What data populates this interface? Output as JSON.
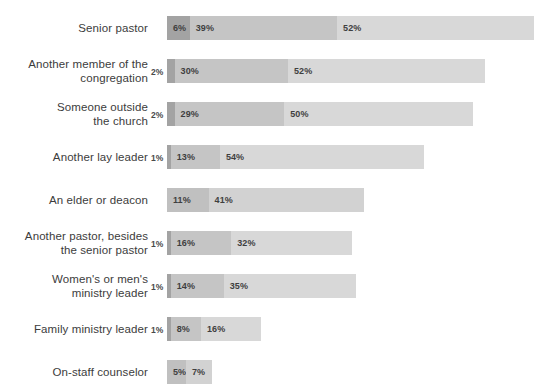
{
  "chart_data": {
    "type": "bar",
    "orientation": "horizontal",
    "stacked": true,
    "title": "",
    "subtitle": "",
    "xlabel": "",
    "ylabel": "",
    "xlim": [
      0,
      100
    ],
    "grid": false,
    "legend": "none",
    "unit": "%",
    "categories": [
      "Senior pastor",
      "Another member of the\ncongregation",
      "Someone outside\nthe church",
      "Another lay leader",
      "An elder or deacon",
      "Another pastor, besides\nthe senior pastor",
      "Women's or men's\nministry leader",
      "Family ministry leader",
      "On-staff counselor"
    ],
    "series": [
      {
        "name": "segment-1",
        "color": "#a3a3a3",
        "values": [
          6,
          2,
          2,
          1,
          11,
          1,
          1,
          1,
          5
        ]
      },
      {
        "name": "segment-2",
        "color": "#c5c5c5",
        "values": [
          39,
          30,
          29,
          13,
          41,
          16,
          14,
          8,
          7
        ]
      },
      {
        "name": "segment-3",
        "color": "#d8d8d8",
        "values": [
          52,
          52,
          50,
          54,
          0,
          32,
          35,
          16,
          0
        ]
      }
    ],
    "rows": [
      {
        "label": "Senior pastor",
        "outside_value": "",
        "segments": [
          {
            "value": 6,
            "label": "6%",
            "color": "#a3a3a3",
            "show_label": true
          },
          {
            "value": 39,
            "label": "39%",
            "color": "#c5c5c5",
            "show_label": true
          },
          {
            "value": 52,
            "label": "52%",
            "color": "#d8d8d8",
            "show_label": true
          }
        ]
      },
      {
        "label": "Another member of the\ncongregation",
        "outside_value": "2%",
        "segments": [
          {
            "value": 2,
            "label": "2%",
            "color": "#a3a3a3",
            "show_label": false
          },
          {
            "value": 30,
            "label": "30%",
            "color": "#c5c5c5",
            "show_label": true
          },
          {
            "value": 52,
            "label": "52%",
            "color": "#d8d8d8",
            "show_label": true
          }
        ]
      },
      {
        "label": "Someone outside\nthe church",
        "outside_value": "2%",
        "segments": [
          {
            "value": 2,
            "label": "2%",
            "color": "#a3a3a3",
            "show_label": false
          },
          {
            "value": 29,
            "label": "29%",
            "color": "#c5c5c5",
            "show_label": true
          },
          {
            "value": 50,
            "label": "50%",
            "color": "#d8d8d8",
            "show_label": true
          }
        ]
      },
      {
        "label": "Another lay leader",
        "outside_value": "1%",
        "segments": [
          {
            "value": 1,
            "label": "1%",
            "color": "#a3a3a3",
            "show_label": false
          },
          {
            "value": 13,
            "label": "13%",
            "color": "#c5c5c5",
            "show_label": true
          },
          {
            "value": 54,
            "label": "54%",
            "color": "#d8d8d8",
            "show_label": true
          }
        ]
      },
      {
        "label": "An elder or deacon",
        "outside_value": "",
        "segments": [
          {
            "value": 11,
            "label": "11%",
            "color": "#c0c0c0",
            "show_label": true
          },
          {
            "value": 41,
            "label": "41%",
            "color": "#d2d2d2",
            "show_label": true
          }
        ]
      },
      {
        "label": "Another pastor, besides\nthe senior pastor",
        "outside_value": "1%",
        "segments": [
          {
            "value": 1,
            "label": "1%",
            "color": "#a3a3a3",
            "show_label": false
          },
          {
            "value": 16,
            "label": "16%",
            "color": "#c5c5c5",
            "show_label": true
          },
          {
            "value": 32,
            "label": "32%",
            "color": "#d8d8d8",
            "show_label": true
          }
        ]
      },
      {
        "label": "Women's or men's\nministry leader",
        "outside_value": "1%",
        "segments": [
          {
            "value": 1,
            "label": "1%",
            "color": "#a3a3a3",
            "show_label": false
          },
          {
            "value": 14,
            "label": "14%",
            "color": "#c5c5c5",
            "show_label": true
          },
          {
            "value": 35,
            "label": "35%",
            "color": "#d8d8d8",
            "show_label": true
          }
        ]
      },
      {
        "label": "Family ministry leader",
        "outside_value": "1%",
        "segments": [
          {
            "value": 1,
            "label": "1%",
            "color": "#a3a3a3",
            "show_label": false
          },
          {
            "value": 8,
            "label": "8%",
            "color": "#c5c5c5",
            "show_label": true
          },
          {
            "value": 16,
            "label": "16%",
            "color": "#d8d8d8",
            "show_label": true
          }
        ]
      },
      {
        "label": "On-staff counselor",
        "outside_value": "",
        "segments": [
          {
            "value": 5,
            "label": "5%",
            "color": "#c0c0c0",
            "show_label": true
          },
          {
            "value": 7,
            "label": "7%",
            "color": "#d2d2d2",
            "show_label": true
          }
        ]
      }
    ]
  },
  "layout": {
    "bar_origin_x": 167,
    "px_per_percent": 3.78,
    "row_pitch": 43,
    "first_row_top": 16,
    "bar_height": 24
  }
}
